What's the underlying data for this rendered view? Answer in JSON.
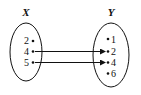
{
  "diagram": {
    "type": "mapping",
    "domain_set": {
      "name": "X",
      "elements": [
        "2",
        "4",
        "5"
      ]
    },
    "codomain_set": {
      "name": "Y",
      "elements": [
        "1",
        "2",
        "4",
        "6"
      ]
    },
    "arrows": [
      {
        "from": "4",
        "to": "2"
      },
      {
        "from": "5",
        "to": "4"
      }
    ]
  }
}
